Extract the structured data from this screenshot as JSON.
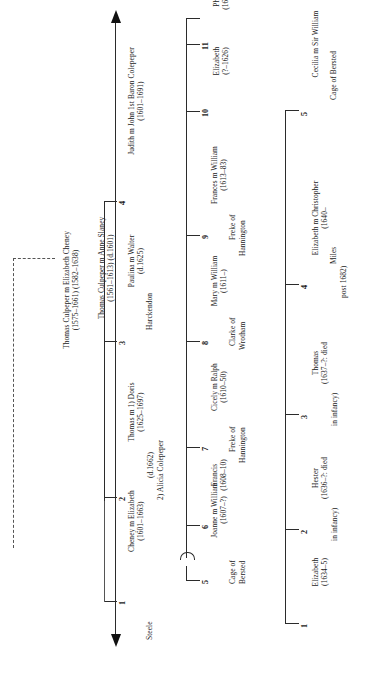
{
  "diagram": {
    "orientation": "rotated-90-ccw",
    "generations": [
      {
        "id": "gen0",
        "people": [
          {
            "name": "Thomas Culpeper m Anne Slaney",
            "dates": "(1561–1613)          (d.1601)"
          }
        ]
      },
      {
        "id": "gen1",
        "people": [
          {
            "name": "Thomas Culpeper m Elizabeth Cheney",
            "dates": "(1575–1661)                 (1582–1638)"
          }
        ]
      }
    ],
    "children": [
      {
        "number": "1",
        "name": "Cheney m Elizabeth",
        "name2": "Steele",
        "dates": "(1601–1663)"
      },
      {
        "number": "2",
        "name": "Thomas m 1) Doris",
        "name2": "2) Alicia Colepeper",
        "dates": "(1625–1697)",
        "dates2": "(d.1662)"
      },
      {
        "number": "3",
        "name": "Paulina m Walter",
        "name2": "Harckendon",
        "dates": "(d.1625)"
      },
      {
        "number": "4",
        "name": "Judith m John 1st Baron Colepeper",
        "dates": "(1601–1691)"
      }
    ],
    "grandchildren_left": [
      {
        "number": "5",
        "name": "Joanne m William",
        "name2": "Cage of",
        "name3": "Bersted",
        "dates": "(1607–?)"
      },
      {
        "number": "6",
        "name": "Francis",
        "dates": "(1608–10)"
      },
      {
        "number": "7",
        "name": "Cicely m Ralph",
        "name2": "Freke of",
        "name3": "Hannington",
        "dates": "(1610–50)"
      },
      {
        "number": "8",
        "name": "Mary m William",
        "name2": "Clarke of",
        "name3": "Wrotham",
        "dates": "(1611–)"
      },
      {
        "number": "9",
        "name": "Frances m William",
        "name2": "Freke of",
        "name3": "Hannington",
        "dates": "(1613–83)"
      },
      {
        "number": "10",
        "name": "Elizabeth",
        "dates": "(?–1626)"
      },
      {
        "number": "11",
        "name": "Philippa",
        "dates": "(1614–38)"
      }
    ],
    "great_grandchildren": [
      {
        "number": "1",
        "name": "Elizabeth",
        "dates": "(1634–5)"
      },
      {
        "number": "2",
        "name": "Hester",
        "dates": "(1636–?: died",
        "dates2": "in infancy)"
      },
      {
        "number": "3",
        "name": "Thomas",
        "dates": "(1637–?: died",
        "dates2": "in infancy)"
      },
      {
        "number": "4",
        "name": "Elizabeth m Christopher",
        "name2": "Miles",
        "dates": "(1640–",
        "dates2": "post 1682)"
      },
      {
        "number": "5",
        "name": "Cecilia m Sir William",
        "name2": "Cage of Bersted"
      }
    ],
    "colors": {
      "line": "#2b2b2b",
      "text": "#1a1a1a",
      "background": "#ffffff"
    }
  }
}
